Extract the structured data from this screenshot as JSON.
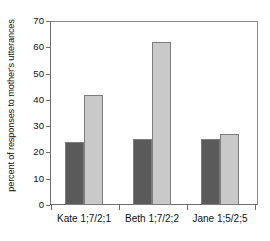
{
  "chart_data": {
    "type": "bar",
    "title": "",
    "xlabel": "",
    "ylabel": "percent of responses to mother's utterances",
    "categories": [
      "Kate 1;7/2;1",
      "Beth 1;7/2;2",
      "Jane 1;5/2;5"
    ],
    "series": [
      {
        "name": "series-1",
        "color": "#5a5a5a",
        "values": [
          24,
          25,
          25
        ]
      },
      {
        "name": "series-2",
        "color": "#c9c9c9",
        "values": [
          42,
          62,
          27
        ]
      }
    ],
    "ylim": [
      0,
      70
    ],
    "ytick_labels": [
      "0",
      "10",
      "20",
      "30",
      "40",
      "50",
      "60",
      "70"
    ],
    "ytick_values": [
      0,
      10,
      20,
      30,
      40,
      50,
      60,
      70
    ],
    "grid": false,
    "legend": "none",
    "frame": "top-right-box",
    "bar_outline_color": "#7d7d7d"
  }
}
